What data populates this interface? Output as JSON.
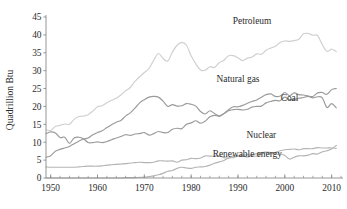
{
  "chart_data": {
    "type": "line",
    "title": "",
    "xlabel": "",
    "ylabel": "Quadrillion Btu",
    "xlim": [
      1949,
      2012
    ],
    "ylim": [
      0,
      45
    ],
    "grid": false,
    "legend_position": "inline-labels",
    "x_ticks": [
      1950,
      1960,
      1970,
      1980,
      1990,
      2000,
      2010
    ],
    "x_tick_labels": [
      "1950",
      "1960",
      "1970",
      "1980",
      "1990",
      "2000",
      "2010"
    ],
    "x_minor_tick_step": 2,
    "y_ticks": [
      0,
      5,
      10,
      15,
      20,
      25,
      30,
      35,
      40,
      45
    ],
    "y_tick_labels": [
      "0",
      "5",
      "10",
      "15",
      "20",
      "25",
      "30",
      "35",
      "40",
      "45"
    ],
    "x": [
      1949,
      1950,
      1951,
      1952,
      1953,
      1954,
      1955,
      1956,
      1957,
      1958,
      1959,
      1960,
      1961,
      1962,
      1963,
      1964,
      1965,
      1966,
      1967,
      1968,
      1969,
      1970,
      1971,
      1972,
      1973,
      1974,
      1975,
      1976,
      1977,
      1978,
      1979,
      1980,
      1981,
      1982,
      1983,
      1984,
      1985,
      1986,
      1987,
      1988,
      1989,
      1990,
      1991,
      1992,
      1993,
      1994,
      1995,
      1996,
      1997,
      1998,
      1999,
      2000,
      2001,
      2002,
      2003,
      2004,
      2005,
      2006,
      2007,
      2008,
      2009,
      2010,
      2011
    ],
    "series": [
      {
        "name": "Petroleum",
        "color": "#cfcfcf",
        "label": "Petroleum",
        "label_x": 1993,
        "label_y": 43.0,
        "values": [
          13.5,
          13.3,
          14.4,
          14.7,
          15.1,
          15.0,
          16.4,
          17.2,
          17.3,
          17.7,
          18.7,
          19.9,
          20.2,
          21.0,
          21.7,
          22.3,
          23.2,
          24.4,
          25.3,
          27.0,
          28.3,
          29.5,
          30.6,
          32.9,
          34.8,
          33.4,
          32.7,
          35.2,
          37.1,
          37.9,
          37.1,
          34.2,
          31.9,
          30.2,
          30.1,
          31.1,
          30.9,
          32.2,
          32.9,
          34.2,
          34.2,
          33.6,
          32.8,
          33.5,
          33.8,
          34.7,
          34.6,
          35.7,
          36.3,
          36.8,
          37.9,
          38.3,
          38.2,
          38.4,
          38.8,
          40.3,
          40.4,
          39.9,
          39.8,
          37.3,
          35.4,
          36.0,
          35.3
        ]
      },
      {
        "name": "Natural gas",
        "color": "#9a9a9a",
        "label": "Natural gas",
        "label_x": 1990,
        "label_y": 26.8,
        "values": [
          5.8,
          6.2,
          7.5,
          8.0,
          8.4,
          8.8,
          9.6,
          10.3,
          10.9,
          11.2,
          12.1,
          12.7,
          13.2,
          14.1,
          14.9,
          15.6,
          16.1,
          17.3,
          18.2,
          19.5,
          21.0,
          21.9,
          22.6,
          22.8,
          22.6,
          21.5,
          20.0,
          20.5,
          20.1,
          20.2,
          20.8,
          20.6,
          20.1,
          18.6,
          17.9,
          18.8,
          18.0,
          17.3,
          18.0,
          19.1,
          19.9,
          19.9,
          20.3,
          20.9,
          21.4,
          21.8,
          22.6,
          23.3,
          23.5,
          22.8,
          22.9,
          23.9,
          23.0,
          23.8,
          23.3,
          23.2,
          22.9,
          22.8,
          23.8,
          23.9,
          23.4,
          24.7,
          25.0
        ]
      },
      {
        "name": "Coal",
        "color": "#9a9a9a",
        "label": "Coal",
        "label_x": 2001,
        "label_y": 21.4,
        "values": [
          12.4,
          12.9,
          12.6,
          11.3,
          11.4,
          9.7,
          11.2,
          11.4,
          11.0,
          9.9,
          9.9,
          10.1,
          9.9,
          10.2,
          10.7,
          11.2,
          11.6,
          12.1,
          11.9,
          12.3,
          12.4,
          12.7,
          12.0,
          12.4,
          13.0,
          12.7,
          12.7,
          13.6,
          13.9,
          13.8,
          15.0,
          15.4,
          16.0,
          15.3,
          15.9,
          17.1,
          17.5,
          17.3,
          18.0,
          18.8,
          19.1,
          19.2,
          19.0,
          19.2,
          19.8,
          20.0,
          20.1,
          21.0,
          21.4,
          21.7,
          21.6,
          22.6,
          21.9,
          21.9,
          22.3,
          22.5,
          22.8,
          22.4,
          22.7,
          22.4,
          19.7,
          20.8,
          19.6
        ]
      },
      {
        "name": "Nuclear",
        "color": "#b4b4b4",
        "label": "Nuclear",
        "label_x": 1995,
        "label_y": 11.2,
        "values": [
          0.0,
          0.0,
          0.0,
          0.0,
          0.0,
          0.0,
          0.0,
          0.0,
          0.0,
          0.0,
          0.0,
          0.0,
          0.0,
          0.0,
          0.0,
          0.0,
          0.0,
          0.1,
          0.1,
          0.1,
          0.2,
          0.2,
          0.4,
          0.6,
          0.9,
          1.3,
          1.9,
          2.1,
          2.7,
          3.0,
          2.8,
          2.7,
          3.0,
          3.1,
          3.2,
          3.6,
          4.1,
          4.5,
          4.9,
          5.6,
          5.7,
          6.1,
          6.4,
          6.5,
          6.4,
          6.8,
          7.1,
          7.2,
          6.7,
          7.1,
          7.6,
          7.9,
          8.0,
          8.1,
          7.9,
          8.2,
          8.2,
          8.2,
          8.5,
          8.4,
          8.4,
          8.4,
          8.3
        ]
      },
      {
        "name": "Renewable energy",
        "color": "#b4b4b4",
        "label": "Renewable energy",
        "label_x": 1992,
        "label_y": 6.0,
        "values": [
          3.1,
          3.0,
          3.0,
          3.0,
          3.0,
          3.0,
          3.0,
          3.1,
          3.2,
          3.3,
          3.3,
          3.3,
          3.4,
          3.6,
          3.7,
          3.8,
          3.9,
          4.0,
          4.2,
          4.3,
          4.4,
          4.3,
          4.3,
          4.4,
          4.8,
          4.8,
          4.7,
          4.8,
          4.4,
          5.0,
          5.1,
          5.5,
          5.4,
          5.6,
          6.2,
          6.1,
          6.1,
          6.2,
          5.7,
          5.6,
          6.2,
          6.1,
          6.2,
          5.9,
          6.2,
          6.1,
          6.6,
          7.2,
          7.1,
          6.6,
          6.7,
          6.3,
          5.3,
          5.8,
          6.2,
          6.2,
          6.4,
          6.8,
          6.7,
          7.3,
          7.6,
          8.1,
          9.1
        ]
      }
    ]
  },
  "axis": {
    "y_title": "Quadrillion Btu"
  }
}
